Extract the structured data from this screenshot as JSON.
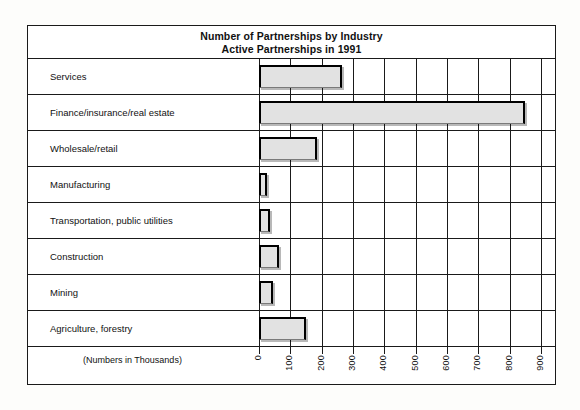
{
  "chart_data": {
    "type": "bar",
    "orientation": "horizontal",
    "title": "Number of Partnerships by Industry",
    "subtitle": "Active Partnerships in 1991",
    "xlabel": "(Numbers in Thousands)",
    "ylabel": "",
    "units_note": "(Numbers in Thousands)",
    "grid": true,
    "legend": false,
    "xlim": [
      0,
      900
    ],
    "xticks": [
      0,
      100,
      200,
      300,
      400,
      500,
      600,
      700,
      800,
      900
    ],
    "xtick_labels": [
      "0",
      "100",
      "200",
      "300",
      "400",
      "500",
      "600",
      "700",
      "800",
      "900"
    ],
    "categories": [
      "Services",
      "Finance/insurance/real estate",
      "Wholesale/retail",
      "Manufacturing",
      "Transportation, public utilities",
      "Construction",
      "Mining",
      "Agriculture, forestry"
    ],
    "values": [
      265,
      850,
      185,
      25,
      35,
      65,
      45,
      150
    ],
    "bar_fill_color": "#e2e2e2",
    "bar_edge_color": "#000000",
    "frame_color": "#1a1a1a"
  }
}
